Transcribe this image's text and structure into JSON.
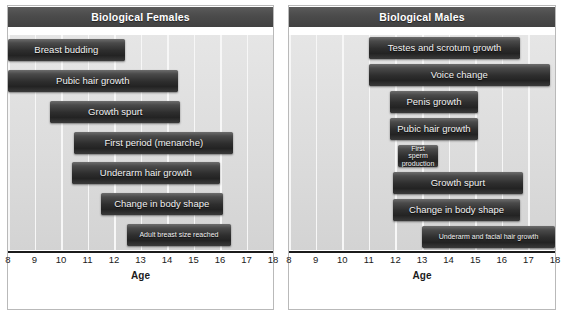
{
  "chart_data": [
    {
      "type": "bar",
      "orientation": "horizontal-timeline",
      "title": "Biological Females",
      "xlabel": "Age",
      "ylabel": "",
      "xlim": [
        8,
        18
      ],
      "ticks": [
        8,
        9,
        10,
        11,
        12,
        13,
        14,
        15,
        16,
        17,
        18
      ],
      "grid": true,
      "legend": "none",
      "categories": [
        "Breast budding",
        "Pubic hair growth",
        "Growth spurt",
        "First period (menarche)",
        "Underarm hair growth",
        "Change in body shape",
        "Adult breast size reached"
      ],
      "ranges": [
        [
          8.0,
          12.4
        ],
        [
          8.0,
          14.4
        ],
        [
          9.6,
          14.5
        ],
        [
          10.5,
          16.5
        ],
        [
          10.4,
          16.0
        ],
        [
          11.5,
          16.1
        ],
        [
          12.5,
          16.4
        ]
      ],
      "bars": [
        {
          "label": "Breast budding",
          "start": 8.0,
          "end": 12.4,
          "small": false
        },
        {
          "label": "Pubic hair growth",
          "start": 8.0,
          "end": 14.4,
          "small": false
        },
        {
          "label": "Growth spurt",
          "start": 9.6,
          "end": 14.5,
          "small": false
        },
        {
          "label": "First period (menarche)",
          "start": 10.5,
          "end": 16.5,
          "small": false
        },
        {
          "label": "Underarm hair growth",
          "start": 10.4,
          "end": 16.0,
          "small": false
        },
        {
          "label": "Change in body shape",
          "start": 11.5,
          "end": 16.1,
          "small": false
        },
        {
          "label": "Adult breast size reached",
          "start": 12.5,
          "end": 16.4,
          "small": true
        }
      ]
    },
    {
      "type": "bar",
      "orientation": "horizontal-timeline",
      "title": "Biological Males",
      "xlabel": "Age",
      "ylabel": "",
      "xlim": [
        8,
        18
      ],
      "ticks": [
        8,
        9,
        10,
        11,
        12,
        13,
        14,
        15,
        16,
        17,
        18
      ],
      "grid": true,
      "legend": "none",
      "categories": [
        "Testes and scrotum growth",
        "Voice change",
        "Penis growth",
        "Pubic hair growth",
        "First sperm production",
        "Growth spurt",
        "Change in body shape",
        "Underarm and facial hair growth"
      ],
      "ranges": [
        [
          11.0,
          16.7
        ],
        [
          11.0,
          17.8
        ],
        [
          11.8,
          15.1
        ],
        [
          11.8,
          15.1
        ],
        [
          12.1,
          13.6
        ],
        [
          11.9,
          16.8
        ],
        [
          11.9,
          16.7
        ],
        [
          13.0,
          18.0
        ]
      ],
      "bars": [
        {
          "label": "Testes and scrotum growth",
          "start": 11.0,
          "end": 16.7,
          "small": false
        },
        {
          "label": "Voice change",
          "start": 11.0,
          "end": 17.8,
          "small": false
        },
        {
          "label": "Penis growth",
          "start": 11.8,
          "end": 15.1,
          "small": false
        },
        {
          "label": "Pubic hair growth",
          "start": 11.8,
          "end": 15.1,
          "small": false
        },
        {
          "label": "First sperm production",
          "start": 12.1,
          "end": 13.6,
          "small": true
        },
        {
          "label": "Growth spurt",
          "start": 11.9,
          "end": 16.8,
          "small": false
        },
        {
          "label": "Change in body shape",
          "start": 11.9,
          "end": 16.7,
          "small": false
        },
        {
          "label": "Underarm and facial hair growth",
          "start": 13.0,
          "end": 18.0,
          "small": true
        }
      ]
    }
  ],
  "colors": {
    "title_bar": "#4b4b4b",
    "plot_background": "#dcdcdc",
    "gridline": "#f7f7f7",
    "bar": "#2e2e2e",
    "bar_text": "#f2f2f2",
    "axis": "#1b1b1b"
  },
  "panels": [
    {
      "title": "Biological Females",
      "axis_title": "Age"
    },
    {
      "title": "Biological Males",
      "axis_title": "Age"
    }
  ]
}
